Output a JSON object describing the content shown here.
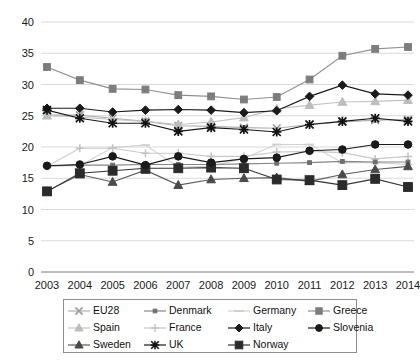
{
  "chart_data": {
    "type": "line",
    "title": "",
    "subtitle": "",
    "xlabel": "",
    "ylabel": "",
    "grid": true,
    "legend_position": "bottom",
    "xlim": [
      2003,
      2014
    ],
    "ylim": [
      0,
      40
    ],
    "ytick_step": 5,
    "categories": [
      "2003",
      "2004",
      "2005",
      "2006",
      "2007",
      "2008",
      "2009",
      "2010",
      "2011",
      "2012",
      "2013",
      "2014"
    ],
    "x": [
      2003,
      2004,
      2005,
      2006,
      2007,
      2008,
      2009,
      2010,
      2011,
      2012,
      2013,
      2014
    ],
    "yticks": [
      "0",
      "5",
      "10",
      "15",
      "20",
      "25",
      "30",
      "35",
      "40"
    ],
    "xticks": [
      "2003",
      "2004",
      "2005",
      "2006",
      "2007",
      "2008",
      "2009",
      "2010",
      "2011",
      "2012",
      "2013",
      "2014"
    ],
    "series": [
      {
        "name": "EU28",
        "marker": "x-cross",
        "color": "#9b9b9b",
        "line_color": "#b0b0b0",
        "values": [
          25.1,
          25.1,
          24.6,
          24.1,
          23.4,
          23.3,
          23.1,
          23.0,
          23.6,
          24.0,
          24.3,
          24.4
        ]
      },
      {
        "name": "Denmark",
        "marker": "small-square",
        "color": "#6e6e6e",
        "line_color": "#858585",
        "values": [
          17.0,
          17.1,
          17.1,
          17.2,
          17.2,
          17.2,
          17.3,
          17.4,
          17.5,
          17.7,
          17.6,
          17.6
        ]
      },
      {
        "name": "Germany",
        "marker": "dash",
        "color": "#cfcfcf",
        "line_color": "#d2d2d2",
        "values": [
          16.9,
          17.0,
          19.9,
          20.3,
          16.8,
          16.9,
          18.2,
          20.4,
          20.4,
          17.5,
          17.5,
          17.2
        ]
      },
      {
        "name": "Greece",
        "marker": "square",
        "color": "#7d7d7d",
        "line_color": "#909090",
        "values": [
          32.8,
          30.7,
          29.3,
          29.2,
          28.3,
          28.1,
          27.6,
          28.0,
          30.8,
          34.6,
          35.7,
          36.0
        ]
      },
      {
        "name": "Spain",
        "marker": "triangle",
        "color": "#bdbdbd",
        "line_color": "#c4c4c4",
        "values": [
          25.0,
          24.8,
          24.4,
          24.1,
          23.6,
          24.0,
          24.7,
          26.1,
          26.7,
          27.2,
          27.3,
          27.5
        ]
      },
      {
        "name": "France",
        "marker": "plus",
        "color": "#c2c2c2",
        "line_color": "#c9c9c9",
        "values": [
          16.9,
          19.8,
          19.8,
          19.0,
          19.0,
          18.5,
          18.5,
          19.2,
          19.3,
          19.1,
          18.1,
          18.5
        ]
      },
      {
        "name": "Italy",
        "marker": "diamond",
        "color": "#1a1a1a",
        "line_color": "#1a1a1a",
        "values": [
          26.2,
          26.2,
          25.6,
          25.9,
          26.0,
          25.9,
          25.5,
          25.8,
          28.1,
          29.9,
          28.5,
          28.3
        ]
      },
      {
        "name": "Slovenia",
        "marker": "circle",
        "color": "#1a1a1a",
        "line_color": "#1a1a1a",
        "values": [
          17.0,
          17.2,
          18.5,
          17.1,
          18.5,
          17.5,
          18.1,
          18.3,
          19.4,
          19.6,
          20.4,
          20.4
        ]
      },
      {
        "name": "Sweden",
        "marker": "triangle",
        "color": "#4a4a4a",
        "line_color": "#5a5a5a",
        "values": [
          12.9,
          15.6,
          14.4,
          16.3,
          13.9,
          14.8,
          15.0,
          15.1,
          14.5,
          15.6,
          16.4,
          16.9
        ]
      },
      {
        "name": "UK",
        "marker": "asterisk",
        "color": "#121212",
        "line_color": "#1a1a1a",
        "values": [
          25.9,
          24.6,
          23.8,
          23.8,
          22.5,
          23.1,
          22.8,
          22.4,
          23.6,
          24.1,
          24.6,
          24.1
        ]
      },
      {
        "name": "Norway",
        "marker": "big-square",
        "color": "#2b2b2b",
        "line_color": "#333333",
        "values": [
          12.9,
          15.8,
          16.2,
          16.6,
          16.6,
          16.7,
          16.6,
          14.8,
          14.7,
          13.9,
          14.9,
          13.6
        ]
      }
    ]
  },
  "legend": {
    "entries": [
      {
        "label": "EU28"
      },
      {
        "label": "Denmark"
      },
      {
        "label": "Germany"
      },
      {
        "label": "Greece"
      },
      {
        "label": "Spain"
      },
      {
        "label": "France"
      },
      {
        "label": "Italy"
      },
      {
        "label": "Slovenia"
      },
      {
        "label": "Sweden"
      },
      {
        "label": "UK"
      },
      {
        "label": "Norway"
      }
    ]
  }
}
